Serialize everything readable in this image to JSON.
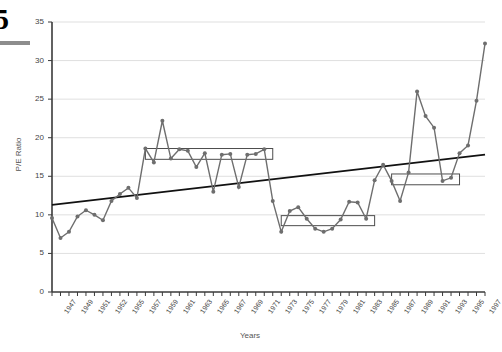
{
  "page": {
    "number": "5"
  },
  "chart_data": {
    "type": "line",
    "title": "",
    "xlabel": "Years",
    "ylabel": "P/E Ratio",
    "ylim": [
      0,
      35
    ],
    "yticks": [
      0,
      5,
      10,
      15,
      20,
      25,
      30,
      35
    ],
    "grid": true,
    "legend": "none",
    "series_color": "#6e6e6e",
    "trend_color": "#111111",
    "box_color": "#4d4d4d",
    "x": [
      1947,
      1948,
      1949,
      1950,
      1951,
      1952,
      1953,
      1954,
      1955,
      1956,
      1957,
      1958,
      1959,
      1960,
      1961,
      1962,
      1963,
      1964,
      1965,
      1966,
      1967,
      1968,
      1969,
      1970,
      1971,
      1972,
      1973,
      1974,
      1975,
      1976,
      1977,
      1978,
      1979,
      1980,
      1981,
      1982,
      1983,
      1984,
      1985,
      1986,
      1987,
      1988,
      1989,
      1990,
      1991,
      1992,
      1993,
      1994,
      1995,
      1996,
      1997,
      1998
    ],
    "xticks": [
      "1947",
      "1949",
      "1951",
      "1952",
      "1955",
      "1957",
      "1959",
      "1961",
      "1963",
      "1965",
      "1967",
      "1969",
      "1971",
      "1973",
      "1975",
      "1977",
      "1979",
      "1981",
      "1983",
      "1985",
      "1987",
      "1989",
      "1991",
      "1993",
      "1995",
      "1997"
    ],
    "values": [
      9.6,
      7.0,
      7.8,
      9.8,
      10.6,
      10.0,
      9.3,
      11.8,
      12.7,
      13.5,
      12.2,
      18.6,
      16.8,
      22.2,
      17.3,
      18.5,
      18.3,
      16.2,
      18.0,
      13.0,
      17.8,
      17.9,
      13.6,
      17.8,
      17.9,
      18.5,
      11.8,
      7.8,
      10.5,
      11.0,
      9.5,
      8.2,
      7.8,
      8.2,
      9.4,
      11.7,
      11.6,
      9.5,
      14.5,
      16.5,
      14.4,
      11.8,
      15.5,
      26.0,
      22.8,
      21.3,
      14.4,
      14.8,
      18.0,
      19.0,
      24.8,
      32.2
    ],
    "annotations": [
      {
        "name": "range-box-1959-1973",
        "x_start": 1958,
        "x_end": 1973,
        "y_top": 18.6,
        "y_bottom": 17.2
      },
      {
        "name": "range-box-1975-1985",
        "x_start": 1974,
        "x_end": 1985,
        "y_top": 9.9,
        "y_bottom": 8.6
      },
      {
        "name": "range-box-1987-1995",
        "x_start": 1987,
        "x_end": 1995,
        "y_top": 15.3,
        "y_bottom": 13.9
      }
    ],
    "trendline": {
      "x_start": 1947,
      "y_start": 11.3,
      "x_end": 1998,
      "y_end": 17.8
    }
  }
}
